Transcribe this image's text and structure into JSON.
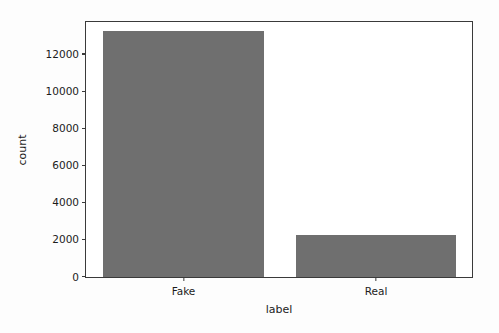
{
  "chart_data": {
    "type": "bar",
    "title": "",
    "xlabel": "label",
    "ylabel": "count",
    "categories": [
      "Fake",
      "Real"
    ],
    "values": [
      13300,
      2250
    ],
    "series": [
      {
        "name": "count",
        "values": [
          13300,
          2250
        ]
      }
    ],
    "ylim": [
      0,
      13770
    ],
    "yticks": [
      0,
      2000,
      4000,
      6000,
      8000,
      10000,
      12000
    ],
    "ytick_labels": [
      "0",
      "2000",
      "4000",
      "6000",
      "8000",
      "10000",
      "12000"
    ],
    "xtick_labels": [
      "Fake",
      "Real"
    ],
    "grid": false,
    "legend": false,
    "legend_position": "none",
    "bar_color": "#6f6f6f",
    "axes_color": "#3a3a3a",
    "background_color": "#ffffff",
    "figure_background_color": "#fdfdfd"
  }
}
